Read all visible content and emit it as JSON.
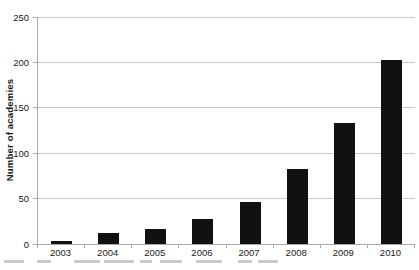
{
  "figure": {
    "y_axis_label": "Number of academies"
  },
  "chart_data": {
    "type": "bar",
    "title": "",
    "categories": [
      "2003",
      "2004",
      "2005",
      "2006",
      "2007",
      "2008",
      "2009",
      "2010"
    ],
    "values": [
      3,
      12,
      17,
      27,
      46,
      83,
      133,
      203
    ],
    "xlabel": "",
    "ylabel": "Number of academies",
    "ylim": [
      0,
      250
    ],
    "yticks": [
      0,
      50,
      100,
      150,
      200,
      250
    ],
    "grid": true,
    "legend": "none",
    "bar_color": "#111111",
    "gridline_color": "#c9c9c9",
    "axis_color": "#a8a8a8",
    "text_color": "#1a1a1a"
  }
}
